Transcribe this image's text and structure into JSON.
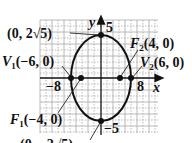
{
  "figure": {
    "type": "ellipse-graph",
    "center": [
      0,
      0
    ],
    "equation_hint": "x^2/36 + y^2/20 = 1"
  },
  "axes": {
    "x_label": "x",
    "y_label": "y",
    "x_ticks": {
      "neg": "−8",
      "pos": "8"
    },
    "y_ticks": {
      "pos": "5",
      "neg": "−5"
    }
  },
  "points": {
    "top": {
      "label": "(0, 2√5)"
    },
    "bottom": {
      "label": "(0, −2√5)"
    },
    "v1": {
      "name": "V",
      "sub": "1",
      "coords": "(−6, 0)"
    },
    "v2": {
      "name": "V",
      "sub": "2",
      "coords": "(6, 0)"
    },
    "f1": {
      "name": "F",
      "sub": "1",
      "coords": "(−4, 0)"
    },
    "f2": {
      "name": "F",
      "sub": "2",
      "coords": "(4, 0)"
    }
  },
  "colors": {
    "grid": "#9a9a9a",
    "curve": "#111111",
    "text": "#111111"
  }
}
